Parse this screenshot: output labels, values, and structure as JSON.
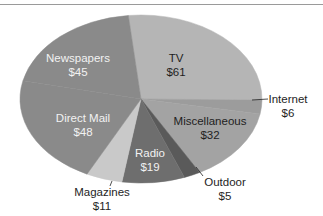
{
  "chart_data": {
    "type": "pie",
    "title": "",
    "unit": "$",
    "categories": [
      "TV",
      "Internet",
      "Miscellaneous",
      "Outdoor",
      "Radio",
      "Magazines",
      "Direct Mail",
      "Newspapers"
    ],
    "values": [
      61,
      6,
      32,
      5,
      19,
      11,
      48,
      45
    ],
    "total": 227,
    "start_angle_deg": -96,
    "direction": "clockwise",
    "colors": [
      "#b5b5b5",
      "#9c9c9c",
      "#a3a3a3",
      "#5a5a5a",
      "#6e6e6e",
      "#c9c9c9",
      "#8a8a8a",
      "#8a8a8a"
    ],
    "labels": [
      {
        "name": "TV",
        "value": "$61",
        "x": 176,
        "y": 62,
        "style": "dark"
      },
      {
        "name": "Internet",
        "value": "$6",
        "x": 287,
        "y": 103,
        "style": "dark",
        "leader": true
      },
      {
        "name": "Miscellaneous",
        "value": "$32",
        "x": 210,
        "y": 125,
        "style": "dark"
      },
      {
        "name": "Outdoor",
        "value": "$5",
        "x": 224,
        "y": 186,
        "style": "dark",
        "leader": true
      },
      {
        "name": "Radio",
        "value": "$19",
        "x": 149,
        "y": 157,
        "style": "light"
      },
      {
        "name": "Magazines",
        "value": "$11",
        "x": 102,
        "y": 196,
        "style": "dark",
        "leader": true
      },
      {
        "name": "Direct Mail",
        "value": "$48",
        "x": 83,
        "y": 121,
        "style": "light"
      },
      {
        "name": "Newspapers",
        "value": "$45",
        "x": 78,
        "y": 62,
        "style": "light"
      }
    ],
    "legend": "none",
    "grid": false
  },
  "labels": {
    "tv": {
      "name": "TV",
      "value": "$61"
    },
    "internet": {
      "name": "Internet",
      "value": "$6"
    },
    "misc": {
      "name": "Miscellaneous",
      "value": "$32"
    },
    "outdoor": {
      "name": "Outdoor",
      "value": "$5"
    },
    "radio": {
      "name": "Radio",
      "value": "$19"
    },
    "magazines": {
      "name": "Magazines",
      "value": "$11"
    },
    "directmail": {
      "name": "Direct Mail",
      "value": "$48"
    },
    "newspapers": {
      "name": "Newspapers",
      "value": "$45"
    }
  }
}
